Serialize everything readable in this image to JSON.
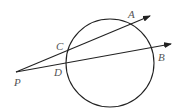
{
  "diagram": {
    "type": "geometry-secant-lines",
    "circle": {
      "cx": 110,
      "cy": 63,
      "r": 44
    },
    "points": {
      "P": {
        "label": "P",
        "x": 16,
        "y": 72
      },
      "C": {
        "label": "C",
        "x": 68,
        "y": 51
      },
      "A": {
        "label": "A",
        "x": 131,
        "y": 24
      },
      "D": {
        "label": "D",
        "x": 67,
        "y": 62
      },
      "B": {
        "label": "B",
        "x": 153,
        "y": 47
      }
    },
    "rays": [
      {
        "from": "P",
        "through": [
          "C",
          "A"
        ],
        "to": {
          "x": 150,
          "y": 16
        }
      },
      {
        "from": "P",
        "through": [
          "D",
          "B"
        ],
        "to": {
          "x": 171,
          "y": 44
        }
      }
    ],
    "labels": {
      "P": "P",
      "C": "C",
      "A": "A",
      "D": "D",
      "B": "B"
    },
    "colors": {
      "stroke": "#222222",
      "label": "#555555"
    }
  }
}
